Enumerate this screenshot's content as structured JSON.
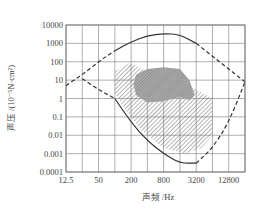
{
  "chart_data": {
    "type": "line",
    "title": "",
    "xlabel": "声频 /Hz",
    "ylabel": "声压 /(10⁻⁵N·cm²)",
    "xscale": "log2",
    "yscale": "log10",
    "xlim": [
      12.5,
      25600
    ],
    "ylim": [
      0.0001,
      10000
    ],
    "x_ticks": [
      "12.5",
      "50",
      "200",
      "800",
      "3200",
      "12800"
    ],
    "y_ticks": [
      "10000",
      "1000",
      "100",
      "10",
      "1",
      "0.1",
      "0.01",
      "0.001",
      "0.0001"
    ],
    "grid": true,
    "series": [
      {
        "name": "pain-threshold (upper solid curve)",
        "style": "solid",
        "points": [
          [
            100,
            400
          ],
          [
            200,
            1200
          ],
          [
            400,
            2600
          ],
          [
            800,
            3500
          ],
          [
            1600,
            3000
          ],
          [
            3200,
            1000
          ]
        ]
      },
      {
        "name": "upper boundary extension (dashed)",
        "style": "dashed",
        "points": [
          [
            12.5,
            5
          ],
          [
            25,
            20
          ],
          [
            50,
            100
          ],
          [
            100,
            400
          ]
        ]
      },
      {
        "name": "upper-right boundary (dashed)",
        "style": "dashed",
        "points": [
          [
            3200,
            1000
          ],
          [
            6400,
            200
          ],
          [
            12800,
            40
          ],
          [
            25600,
            8
          ]
        ]
      },
      {
        "name": "hearing-threshold (lower solid curve)",
        "style": "solid",
        "points": [
          [
            100,
            1
          ],
          [
            200,
            0.05
          ],
          [
            400,
            0.005
          ],
          [
            800,
            0.001
          ],
          [
            1600,
            0.0003
          ],
          [
            3200,
            0.0003
          ]
        ]
      },
      {
        "name": "lower-left boundary (dashed)",
        "style": "dashed",
        "points": [
          [
            25,
            12
          ],
          [
            50,
            3
          ],
          [
            100,
            1
          ]
        ]
      },
      {
        "name": "lower-right boundary (dashed)",
        "style": "dashed",
        "points": [
          [
            3200,
            0.0003
          ],
          [
            6400,
            0.002
          ],
          [
            12800,
            0.05
          ],
          [
            25600,
            8
          ]
        ]
      }
    ],
    "regions": [
      {
        "name": "speech area (hatched)",
        "fill": "diagonal-hatch",
        "approx_range_hz": [
          100,
          8000
        ],
        "approx_range_pressure": [
          0.001,
          30
        ]
      },
      {
        "name": "music area (dense hatch / grey)",
        "fill": "cross-hatch",
        "approx_range_hz": [
          200,
          3200
        ],
        "approx_range_pressure": [
          0.5,
          30
        ]
      }
    ]
  },
  "colors": {
    "grid": "#7a7a7a",
    "curve": "#333333",
    "hatch": "#6a6a6a",
    "dense_fill": "#9a9a9a",
    "text": "#444444"
  }
}
